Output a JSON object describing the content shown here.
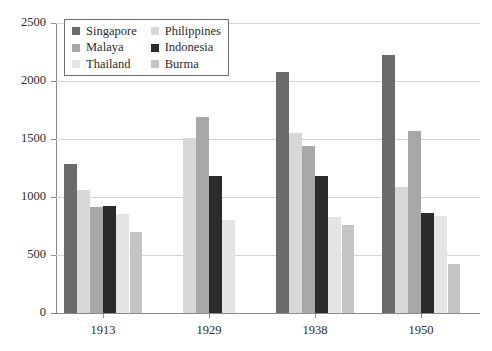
{
  "chart_data": {
    "type": "bar",
    "title": "",
    "subtitle": "",
    "xlabel": "",
    "ylabel": "",
    "categories": [
      "1913",
      "1929",
      "1938",
      "1950"
    ],
    "ylim": [
      0,
      2500
    ],
    "yticks": [
      0,
      500,
      1000,
      1500,
      2000,
      2500
    ],
    "ytick_labels": [
      "0",
      "500",
      "1000",
      "1500",
      "2000",
      "2500"
    ],
    "grid": true,
    "legend_position": "top-left",
    "series": [
      {
        "name": "Singapore",
        "color": "#6b6b6b",
        "values": [
          1285,
          null,
          2080,
          2225
        ]
      },
      {
        "name": "Philippines",
        "color": "#d8d8d8",
        "values": [
          1060,
          1505,
          1555,
          1090
        ]
      },
      {
        "name": "Malaya",
        "color": "#a8a8a8",
        "values": [
          915,
          1690,
          1440,
          1570
        ]
      },
      {
        "name": "Indonesia",
        "color": "#2b2b2b",
        "values": [
          920,
          1180,
          1185,
          860
        ]
      },
      {
        "name": "Thailand",
        "color": "#e4e4e4",
        "values": [
          855,
          800,
          830,
          835
        ]
      },
      {
        "name": "Burma",
        "color": "#c4c4c4",
        "values": [
          695,
          null,
          760,
          420
        ]
      }
    ]
  },
  "legend": {
    "entries": [
      {
        "label": "Singapore",
        "color": "#6b6b6b"
      },
      {
        "label": "Philippines",
        "color": "#d8d8d8"
      },
      {
        "label": "Malaya",
        "color": "#a8a8a8"
      },
      {
        "label": "Indonesia",
        "color": "#2b2b2b"
      },
      {
        "label": "Thailand",
        "color": "#e4e4e4"
      },
      {
        "label": "Burma",
        "color": "#c4c4c4"
      }
    ]
  },
  "axis": {
    "y_labels": [
      "2500",
      "2000",
      "1500",
      "1000",
      "500",
      "0"
    ],
    "x_labels": [
      "1913",
      "1929",
      "1938",
      "1950"
    ]
  },
  "colors": {
    "grid": "#d4d4d4",
    "axis": "#8a8a8a",
    "text": "#2b2b2b",
    "background": "#ffffff",
    "legend_border": "#6f6f6f"
  }
}
